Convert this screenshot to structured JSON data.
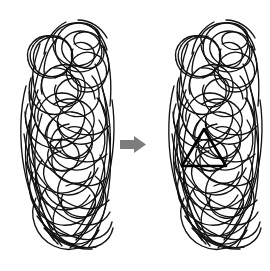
{
  "figure": {
    "type": "illustration",
    "description": "Embedded figures task: a dense tangle of scribbled lines on the left, an arrow, and the same tangle on the right with a hidden triangle revealed in bold",
    "background_color": "#ffffff",
    "line_color": "#111111",
    "highlight_color": "#000000",
    "arrow_color": "#7d7d7d",
    "width": 270,
    "height": 271
  },
  "panels": [
    {
      "id": "left-panel",
      "name": "scribble-tangle-plain",
      "label": "Tangle without highlighted figure",
      "bounds": {
        "x": 20,
        "y": 18,
        "width": 100,
        "height": 235
      },
      "has_highlight": false
    },
    {
      "id": "right-panel",
      "name": "scribble-tangle-with-triangle",
      "label": "Tangle with embedded triangle highlighted",
      "bounds": {
        "x": 168,
        "y": 18,
        "width": 100,
        "height": 235
      },
      "has_highlight": true
    }
  ],
  "arrow": {
    "name": "transition-arrow",
    "direction": "right",
    "color": "#7d7d7d",
    "bounds": {
      "x": 120,
      "y": 136,
      "width": 26,
      "height": 17
    }
  },
  "highlight": {
    "name": "embedded-triangle",
    "shape": "triangle",
    "color": "#000000",
    "apex": {
      "x": 204,
      "y": 129
    },
    "base_left": {
      "x": 182,
      "y": 166
    },
    "base_right": {
      "x": 226,
      "y": 166
    }
  }
}
